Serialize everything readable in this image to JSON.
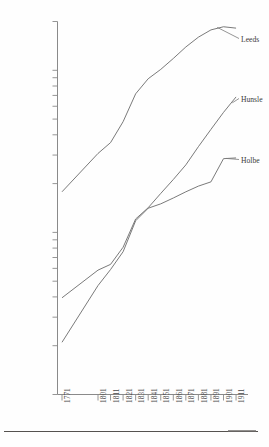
{
  "chart_data": {
    "type": "line",
    "title": "",
    "subtitle": "",
    "xlabel": "",
    "ylabel": "",
    "yscale": "log",
    "ylim": [
      1000,
      200000
    ],
    "grid": false,
    "legend_position": "right-inline-labels",
    "x": [
      1771,
      1801,
      1811,
      1821,
      1831,
      1841,
      1851,
      1861,
      1871,
      1881,
      1891,
      1901,
      1911
    ],
    "categories": [
      "1771",
      "1801",
      "1811",
      "1821",
      "1831",
      "1841",
      "1851",
      "1861",
      "1871",
      "1881",
      "1891",
      "1901",
      "1911"
    ],
    "ytick_values": [
      1000,
      2000,
      3000,
      4000,
      5000,
      6000,
      7000,
      8000,
      9000,
      10000,
      20000,
      30000,
      40000,
      50000,
      60000,
      70000,
      80000,
      90000,
      100000,
      200000
    ],
    "ytick_labels": [
      "1,000",
      "2,000",
      "3,000",
      "4,000",
      "5,000",
      "6,000",
      "7,000",
      "8,000",
      "9,000",
      "10,000",
      "20,000",
      "30,000",
      "40,000",
      "50,000",
      "60,000",
      "70,000",
      "80,000",
      "90,000",
      "100,000",
      "200,000"
    ],
    "series": [
      {
        "name": "Leeds",
        "label": "Leeds",
        "color": "#6b6b6b",
        "x": [
          1771,
          1801,
          1811,
          1821,
          1831,
          1841,
          1851,
          1861,
          1871,
          1881,
          1891,
          1901,
          1911
        ],
        "values": [
          17800,
          30700,
          35800,
          48200,
          71600,
          88700,
          101300,
          118300,
          139300,
          160100,
          177500,
          185600,
          182000
        ]
      },
      {
        "name": "Hunslet",
        "label": "Hunsle",
        "color": "#6b6b6b",
        "x": [
          1771,
          1801,
          1811,
          1821,
          1831,
          1841,
          1851,
          1861,
          1871,
          1881,
          1891,
          1901,
          1911
        ],
        "values": [
          3950,
          5850,
          6350,
          8100,
          12100,
          14200,
          17400,
          21200,
          26100,
          33800,
          43200,
          55000,
          68500
        ]
      },
      {
        "name": "Holbeck",
        "label": "Holbe",
        "color": "#6b6b6b",
        "x": [
          1771,
          1801,
          1811,
          1821,
          1831,
          1841,
          1851,
          1861,
          1871,
          1881,
          1891,
          1901,
          1911
        ],
        "values": [
          2100,
          4700,
          5900,
          7600,
          11800,
          14100,
          15000,
          16300,
          17800,
          19300,
          20500,
          28500,
          28800
        ]
      }
    ],
    "annotations": [
      {
        "text": "Leeds",
        "target_x": 1901,
        "target_y": 185600
      },
      {
        "text": "Hunsle",
        "target_x": 1911,
        "target_y": 68500
      },
      {
        "text": "Holbe",
        "target_x": 1901,
        "target_y": 28500
      }
    ]
  },
  "axis": {
    "y_axis_name": "population-axis",
    "x_axis_name": "year-axis"
  }
}
